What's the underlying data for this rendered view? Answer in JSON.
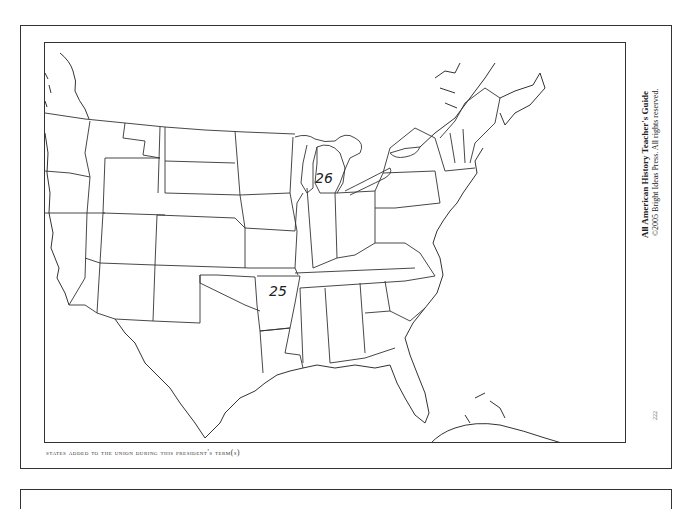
{
  "credit": {
    "title": "All American History Teacher's Guide",
    "copyright": "©2005 Bright Ideas Press. All rights reserved."
  },
  "caption": "States added to the Union during this president's term(s)",
  "page_number": "222",
  "map": {
    "labels": [
      {
        "id": "michigan",
        "text": "26",
        "x": 270,
        "y": 140
      },
      {
        "id": "arkansas",
        "text": "25",
        "x": 224,
        "y": 253
      }
    ]
  }
}
